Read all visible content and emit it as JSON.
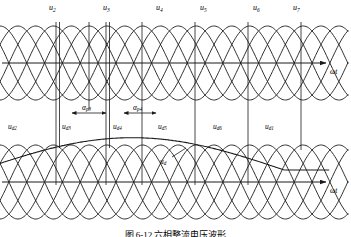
{
  "figure": {
    "axis_label_top": "ωt",
    "axis_label_bottom": "ωt",
    "caption": "图 6-12  六相整流电压波形"
  },
  "top_plot": {
    "phase_labels": [
      {
        "base": "u",
        "sub": "2",
        "x": 49,
        "y": 4
      },
      {
        "base": "u",
        "sub": "3",
        "x": 103,
        "y": 4
      },
      {
        "base": "u",
        "sub": "4",
        "x": 156,
        "y": 4
      },
      {
        "base": "u",
        "sub": "5",
        "x": 200,
        "y": 4
      },
      {
        "base": "u",
        "sub": "6",
        "x": 253,
        "y": 4
      },
      {
        "base": "u",
        "sub": "7",
        "x": 293,
        "y": 4
      }
    ]
  },
  "annotations": {
    "alpha_labels": [
      {
        "base": "α",
        "sub": "p3",
        "x": 82,
        "y": 104
      },
      {
        "base": "α",
        "sub": "p4",
        "x": 133,
        "y": 104
      }
    ],
    "ud_labels": [
      {
        "base": "u",
        "sub": "d2",
        "x": 8,
        "y": 123
      },
      {
        "base": "u",
        "sub": "d3",
        "x": 62,
        "y": 123
      },
      {
        "base": "u",
        "sub": "d4",
        "x": 113,
        "y": 123
      },
      {
        "base": "u",
        "sub": "d5",
        "x": 158,
        "y": 123
      },
      {
        "base": "u",
        "sub": "d6",
        "x": 213,
        "y": 123
      },
      {
        "base": "u",
        "sub": "d1",
        "x": 265,
        "y": 123
      }
    ]
  },
  "bottom_plot": {
    "output_label": {
      "base": "u",
      "sub": "d",
      "x": 160,
      "y": 158
    }
  },
  "colors": {
    "line": "#1a1a1a",
    "background": "#ffffff"
  }
}
